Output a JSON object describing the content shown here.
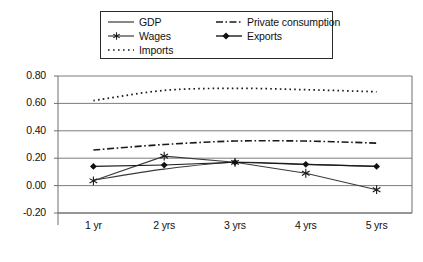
{
  "chart_data": {
    "type": "line",
    "title": "",
    "subtitle": "",
    "xlabel": "",
    "ylabel": "",
    "categories": [
      "1 yr",
      "2 yrs",
      "3 yrs",
      "4 yrs",
      "5 yrs"
    ],
    "ylim": [
      -0.2,
      0.8
    ],
    "yticks": [
      "-0.20",
      "0.00",
      "0.20",
      "0.40",
      "0.60",
      "0.80"
    ],
    "ytick_values": [
      -0.2,
      0.0,
      0.2,
      0.4,
      0.6,
      0.8
    ],
    "grid": "horizontal",
    "legend_position": "top-center",
    "series": [
      {
        "name": "GDP",
        "style": "solid",
        "marker": "none",
        "color": "#3a3a3a",
        "values": [
          0.04,
          0.12,
          0.17,
          0.155,
          0.14
        ]
      },
      {
        "name": "Private consumption",
        "style": "dash-dot",
        "marker": "none",
        "color": "#1a1a1a",
        "values": [
          0.26,
          0.3,
          0.325,
          0.325,
          0.31
        ]
      },
      {
        "name": "Wages",
        "style": "solid",
        "marker": "asterisk",
        "color": "#3a3a3a",
        "values": [
          0.035,
          0.215,
          0.17,
          0.09,
          -0.03
        ]
      },
      {
        "name": "Exports",
        "style": "solid",
        "marker": "diamond",
        "color": "#1a1a1a",
        "values": [
          0.14,
          0.15,
          0.17,
          0.155,
          0.14
        ]
      },
      {
        "name": "Imports",
        "style": "dotted",
        "marker": "none",
        "color": "#1a1a1a",
        "values": [
          0.62,
          0.695,
          0.71,
          0.7,
          0.685
        ]
      }
    ]
  },
  "legend": {
    "entries": [
      {
        "label": "GDP"
      },
      {
        "label": "Private consumption"
      },
      {
        "label": "Wages"
      },
      {
        "label": "Exports"
      },
      {
        "label": "Imports"
      }
    ]
  },
  "axes": {
    "y_tick_labels": [
      "0.80",
      "0.60",
      "0.40",
      "0.20",
      "0.00",
      "-0.20"
    ],
    "x_tick_labels": [
      "1 yr",
      "2 yrs",
      "3 yrs",
      "4 yrs",
      "5 yrs"
    ]
  },
  "colors": {
    "axis": "#6e6e6e",
    "grid": "#6e6e6e",
    "ink": "#1a1a1a",
    "background": "#ffffff"
  }
}
